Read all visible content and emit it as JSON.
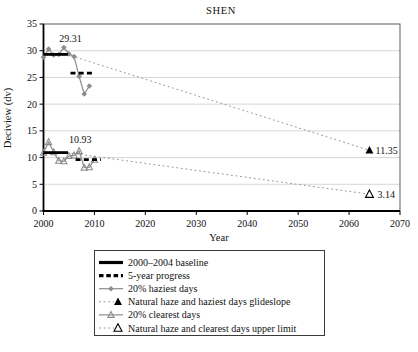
{
  "chart_data": {
    "type": "line",
    "title": "SHEN",
    "xlabel": "Year",
    "ylabel": "Deciview (dv)",
    "xlim": [
      2000,
      2070
    ],
    "ylim": [
      0,
      35
    ],
    "x_ticks": [
      2000,
      2010,
      2020,
      2030,
      2040,
      2050,
      2060,
      2070
    ],
    "y_ticks": [
      0,
      5,
      10,
      15,
      20,
      25,
      30,
      35
    ],
    "grid": "horizontal",
    "legend_position": "bottom-outside",
    "series": [
      {
        "name": "Natural haze and haziest days glideslope",
        "style": "dotted_line",
        "end_marker": "filled_triangle",
        "x": [
          2004.6,
          2064
        ],
        "y": [
          29.31,
          11.35
        ]
      },
      {
        "name": "Natural haze and clearest days upper limit",
        "style": "dotted_line",
        "end_marker": "open_triangle",
        "x": [
          2004.6,
          2064
        ],
        "y": [
          10.93,
          3.14
        ]
      },
      {
        "name": "20% haziest days",
        "style": "gray_line_diamond",
        "x": [
          2000,
          2001,
          2002,
          2003,
          2004,
          2005,
          2006,
          2007,
          2008,
          2009
        ],
        "y": [
          28.8,
          30.3,
          29.2,
          29.3,
          30.6,
          29.4,
          28.9,
          25.2,
          21.9,
          23.4
        ]
      },
      {
        "name": "20% clearest days",
        "style": "gray_line_star",
        "x": [
          2000,
          2001,
          2002,
          2003,
          2004,
          2005,
          2006,
          2007,
          2008,
          2009,
          2010
        ],
        "y": [
          10.9,
          12.9,
          11.0,
          9.4,
          9.3,
          10.3,
          10.4,
          11.2,
          8.1,
          8.2,
          9.6
        ]
      },
      {
        "name": "2000-2004 baseline (haziest days)",
        "style": "solid_thick",
        "x": [
          2000,
          2004.8
        ],
        "y": [
          29.31,
          29.31
        ]
      },
      {
        "name": "2000-2004 baseline (clearest days)",
        "style": "solid_thick",
        "x": [
          2000,
          2004.8
        ],
        "y": [
          10.93,
          10.93
        ]
      },
      {
        "name": "5-year progress (haziest days)",
        "style": "dashed_thick",
        "x": [
          2005.3,
          2010
        ],
        "y": [
          25.8,
          25.8
        ]
      },
      {
        "name": "5-year progress (clearest days)",
        "style": "dashed_thick",
        "x": [
          2006.3,
          2011.3
        ],
        "y": [
          9.6,
          9.6
        ]
      }
    ],
    "annotations": [
      {
        "text": "29.31",
        "year": 2005.3,
        "dv": 31.7,
        "anchor": "middle"
      },
      {
        "text": "10.93",
        "year": 2007.2,
        "dv": 12.65,
        "anchor": "middle"
      },
      {
        "text": "11.35",
        "year": 2065.0,
        "dv": 11.35,
        "anchor": "start"
      },
      {
        "text": "3.14",
        "year": 2065.4,
        "dv": 3.14,
        "anchor": "start"
      }
    ],
    "legend": {
      "items": [
        {
          "label": "2000–2004 baseline",
          "style": "solid_thick"
        },
        {
          "label": "5-year progress",
          "style": "dashed_thick"
        },
        {
          "label": "20% haziest days",
          "style": "gray_line_diamond"
        },
        {
          "label": "Natural haze and haziest days glideslope",
          "style": "dotted_filled_triangle"
        },
        {
          "label": "20% clearest days",
          "style": "gray_line_star"
        },
        {
          "label": "Natural haze and clearest days upper limit",
          "style": "dotted_open_triangle"
        }
      ]
    },
    "colors": {
      "series_gray": "#8c8c8c",
      "dotted_gray": "#949494",
      "black": "#000000",
      "grid": "#cccccc",
      "frame": "#4a4a4a"
    }
  }
}
